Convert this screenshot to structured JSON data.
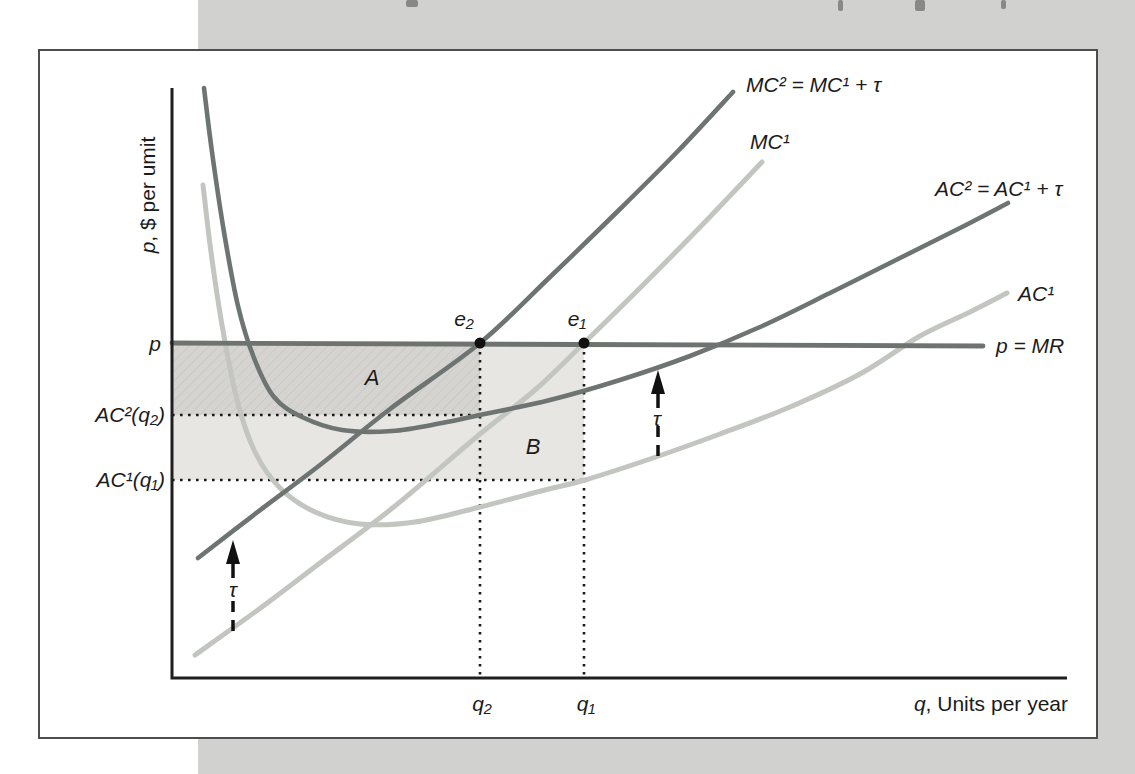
{
  "palette": {
    "dark_curve": "#6e7472",
    "light_curve": "#c3c6c0",
    "price_line": "#6f7370",
    "axis": "#1f1f1f",
    "dotted": "#1a1a1a",
    "region_a": "#d5d4d0",
    "region_a_hatch": "#c8c7c3",
    "region_b": "#e7e6e2",
    "band": "#d1d1cf",
    "figure_border": "#4d4d4d",
    "text": "#1b1b1b",
    "dot": "#111111",
    "arrow": "#111111"
  },
  "labels": {
    "y_axis": {
      "var": "p",
      "rest": ", $ per umit"
    },
    "x_axis": {
      "var": "q",
      "rest": ", Units per year"
    },
    "price": "p",
    "price_line": "p = MR",
    "mc2": "MC² = MC¹ + τ",
    "mc1": "MC¹",
    "ac2": "AC² = AC¹ + τ",
    "ac1": "AC¹",
    "ac2_at_q2": "AC²(q₂)",
    "ac1_at_q1": "AC¹(q₁)",
    "e2": "e₂",
    "e1": "e₁",
    "q2": "q₂",
    "q1": "q₁",
    "region_a": "A",
    "region_b": "B",
    "tau": "τ"
  },
  "chart_data": {
    "type": "line",
    "title": "",
    "xlabel": "q, Units per year",
    "ylabel": "p, $ per umit",
    "axes_numeric": false,
    "grid": false,
    "legend": "inline curve labels",
    "coordinate_space": "screenshot pixels, y increases downward",
    "x_axis_ticks": [
      {
        "label": "q₂",
        "x": 482
      },
      {
        "label": "q₁",
        "x": 586
      }
    ],
    "y_axis_ticks": [
      {
        "label": "p",
        "y": 343
      },
      {
        "label": "AC²(q₂)",
        "y": 415
      },
      {
        "label": "AC¹(q₁)",
        "y": 480
      }
    ],
    "series": [
      {
        "id": "mc1",
        "name": "MC¹",
        "color": "light",
        "points": [
          [
            195,
            655
          ],
          [
            255,
            612
          ],
          [
            320,
            563
          ],
          [
            395,
            506
          ],
          [
            480,
            434
          ],
          [
            535,
            390
          ],
          [
            584,
            343
          ],
          [
            645,
            283
          ],
          [
            705,
            222
          ],
          [
            762,
            162
          ]
        ]
      },
      {
        "id": "ac1",
        "name": "AC¹",
        "color": "light",
        "points": [
          [
            203,
            185
          ],
          [
            211,
            252
          ],
          [
            222,
            325
          ],
          [
            237,
            400
          ],
          [
            255,
            452
          ],
          [
            280,
            488
          ],
          [
            315,
            512
          ],
          [
            360,
            524
          ],
          [
            415,
            522
          ],
          [
            480,
            507
          ],
          [
            545,
            490
          ],
          [
            585,
            480
          ],
          [
            650,
            459
          ],
          [
            720,
            434
          ],
          [
            790,
            407
          ],
          [
            860,
            374
          ],
          [
            920,
            336
          ],
          [
            970,
            312
          ],
          [
            1007,
            293
          ]
        ]
      },
      {
        "id": "price",
        "name": "p = MR",
        "color": "price",
        "points": [
          [
            172,
            343
          ],
          [
            983,
            346
          ]
        ]
      },
      {
        "id": "ac2",
        "name": "AC² = AC¹ + τ",
        "color": "dark",
        "points": [
          [
            204,
            88
          ],
          [
            212,
            152
          ],
          [
            224,
            232
          ],
          [
            238,
            306
          ],
          [
            254,
            358
          ],
          [
            274,
            397
          ],
          [
            302,
            417
          ],
          [
            342,
            430
          ],
          [
            392,
            431
          ],
          [
            442,
            423
          ],
          [
            480,
            415
          ],
          [
            550,
            400
          ],
          [
            620,
            380
          ],
          [
            690,
            356
          ],
          [
            760,
            327
          ],
          [
            830,
            293
          ],
          [
            900,
            258
          ],
          [
            960,
            228
          ],
          [
            1008,
            203
          ]
        ]
      },
      {
        "id": "mc2",
        "name": "MC² = MC¹ + τ",
        "color": "dark",
        "points": [
          [
            198,
            558
          ],
          [
            255,
            514
          ],
          [
            320,
            465
          ],
          [
            390,
            409
          ],
          [
            480,
            343
          ],
          [
            550,
            277
          ],
          [
            620,
            209
          ],
          [
            678,
            151
          ],
          [
            733,
            92
          ]
        ]
      }
    ],
    "points": [
      {
        "id": "e2",
        "label": "e₂",
        "x": 480,
        "y": 343
      },
      {
        "id": "e1",
        "label": "e₁",
        "x": 584,
        "y": 343
      }
    ],
    "regions": [
      {
        "id": "a",
        "label": "A",
        "x1": 173,
        "y1": 345,
        "x2": 480,
        "y2": 415
      },
      {
        "id": "b",
        "label": "B",
        "x1": 173,
        "y1": 345,
        "x2": 584,
        "y2": 480
      }
    ],
    "guides": [
      {
        "name": "q2-vertical",
        "from": [
          480,
          352
        ],
        "to": [
          480,
          678
        ]
      },
      {
        "name": "q1-vertical",
        "from": [
          584,
          352
        ],
        "to": [
          584,
          678
        ]
      },
      {
        "name": "ac2q2-horizontal",
        "from": [
          172,
          415
        ],
        "to": [
          480,
          415
        ]
      },
      {
        "name": "ac1q1-horizontal",
        "from": [
          172,
          480
        ],
        "to": [
          584,
          480
        ]
      }
    ],
    "tax_arrows": [
      {
        "name": "tau-arrow-left",
        "x": 233,
        "tip_y": 540,
        "tail_y": 631,
        "label": "τ"
      },
      {
        "name": "tau-arrow-right",
        "x": 658,
        "tip_y": 370,
        "tail_y": 456,
        "label": "τ"
      }
    ]
  },
  "geometry": {
    "canvas": {
      "w": 1135,
      "h": 774
    },
    "scan_band": {
      "x": 198,
      "y": 0,
      "w": 937,
      "h": 774
    },
    "figure_box": {
      "x": 38,
      "y": 49,
      "w": 1060,
      "h": 690,
      "border_w": 2
    },
    "axes": {
      "origin_x": 172,
      "origin_y": 678,
      "x_end": 1067,
      "y_top": 88
    },
    "fragments": [
      [
        406,
        0,
        12,
        7
      ],
      [
        838,
        0,
        5,
        11
      ],
      [
        915,
        0,
        10,
        11
      ],
      [
        1001,
        0,
        5,
        9
      ]
    ]
  }
}
